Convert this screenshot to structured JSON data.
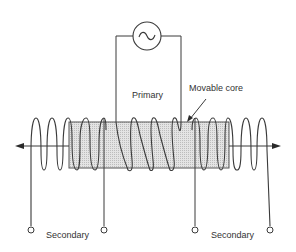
{
  "diagram": {
    "labels": {
      "primary": "Primary",
      "movable_core": "Movable core",
      "secondary_left": "Secondary",
      "secondary_right": "Secondary"
    },
    "source_icon": "ac-source-icon",
    "colors": {
      "line": "#3a3a3a",
      "core_fill": "#d9d9d9",
      "background": "#ffffff"
    }
  }
}
